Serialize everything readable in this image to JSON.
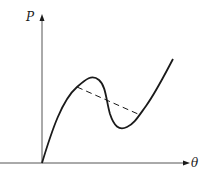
{
  "diagram": {
    "type": "load-displacement curve with snap-through (Maxwell line)",
    "axes": {
      "y_label": "P",
      "x_label": "θ"
    },
    "colors": {
      "stroke": "#1a1a1a",
      "background": "#ffffff"
    },
    "curve": {
      "description": "S-shaped curve rising from origin to a local maximum, descending to a local minimum, then rising again",
      "style": "solid"
    },
    "dashed_line": {
      "description": "Straight dashed line connecting the rising branch to the final rising branch, crossing the descending branch",
      "style": "dashed"
    }
  }
}
